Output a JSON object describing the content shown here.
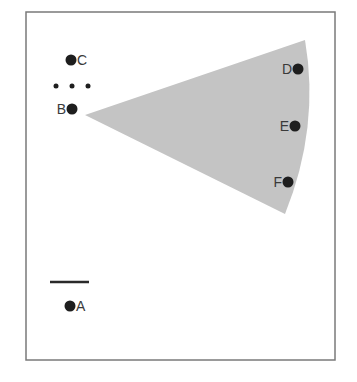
{
  "diagram": {
    "colors": {
      "background": "#ffffff",
      "frame": "#7a7a7a",
      "wedge": "#c4c4c4",
      "dot": "#1e1e1e",
      "label": "#3a3a3a",
      "line": "#2a2a2a"
    },
    "frame": {
      "x1": 26,
      "y1": 12,
      "x2": 335,
      "y2": 360
    },
    "wedge": {
      "apex": [
        85,
        115
      ],
      "top": [
        305,
        40
      ],
      "bottom": [
        285,
        214
      ],
      "arc_control": [
        320,
        127
      ]
    },
    "points": [
      {
        "id": "C",
        "label": "C",
        "cx": 71,
        "cy": 60,
        "label_side": "right"
      },
      {
        "id": "B",
        "label": "B",
        "cx": 72,
        "cy": 109,
        "label_side": "left"
      },
      {
        "id": "D",
        "label": "D",
        "cx": 298,
        "cy": 69,
        "label_side": "left"
      },
      {
        "id": "E",
        "label": "E",
        "cx": 295,
        "cy": 126,
        "label_side": "left"
      },
      {
        "id": "F",
        "label": "F",
        "cx": 288,
        "cy": 182,
        "label_side": "left"
      },
      {
        "id": "A",
        "label": "A",
        "cx": 70,
        "cy": 306,
        "label_side": "right"
      }
    ],
    "ellipsis_dots": [
      {
        "cx": 56,
        "cy": 86
      },
      {
        "cx": 72,
        "cy": 86
      },
      {
        "cx": 88,
        "cy": 86
      }
    ],
    "bar_line": {
      "x1": 50,
      "y1": 282,
      "x2": 89,
      "y2": 282
    }
  }
}
